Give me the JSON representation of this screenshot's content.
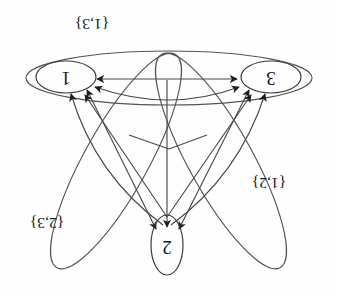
{
  "figure": {
    "background_color": "#fefefe",
    "line_color": "#4a4a4a",
    "text_color": "#161616",
    "orientation_note": "printed upside down",
    "rotation_degrees": 180
  },
  "nodes": [
    {
      "id": "n1",
      "label": "1",
      "x": 271,
      "y": 218,
      "rx": 30,
      "ry": 16
    },
    {
      "id": "n2",
      "label": "2",
      "x": 170,
      "y": 50,
      "rx": 16,
      "ry": 30
    },
    {
      "id": "n3",
      "label": "3",
      "x": 66,
      "y": 218,
      "rx": 30,
      "ry": 16
    }
  ],
  "hulls": [
    {
      "id": "h13",
      "label": "{1,3}",
      "label_x": 245,
      "label_y": 272,
      "pair": [
        1,
        3
      ]
    },
    {
      "id": "h12",
      "label": "{1,2}",
      "label_x": 68,
      "label_y": 113,
      "pair": [
        1,
        2
      ]
    },
    {
      "id": "h23",
      "label": "{2,3}",
      "label_x": 290,
      "label_y": 73,
      "pair": [
        2,
        3
      ]
    }
  ],
  "edges": [
    {
      "from": "3",
      "to": "1",
      "kind": "straight"
    },
    {
      "from": "1",
      "to": "3",
      "kind": "straight"
    },
    {
      "from": "3",
      "to": "1",
      "kind": "arc"
    },
    {
      "from": "1",
      "to": "3",
      "kind": "arc"
    },
    {
      "from": "2",
      "to": "1",
      "kind": "straight"
    },
    {
      "from": "1",
      "to": "2",
      "kind": "straight"
    },
    {
      "from": "2",
      "to": "3",
      "kind": "straight"
    },
    {
      "from": "3",
      "to": "2",
      "kind": "straight"
    },
    {
      "from": "2",
      "to": "1",
      "kind": "curve"
    },
    {
      "from": "2",
      "to": "3",
      "kind": "curve"
    },
    {
      "from": "2",
      "to": "2",
      "kind": "vertical"
    }
  ],
  "arrowheads_into": {
    "node_1": 3,
    "node_2": 3,
    "node_3": 3
  }
}
